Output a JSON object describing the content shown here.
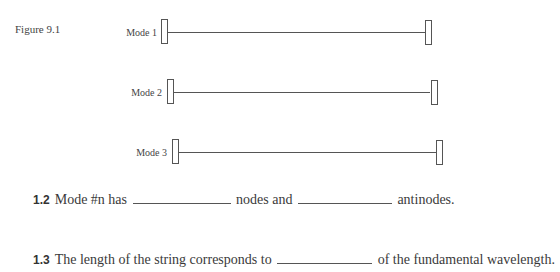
{
  "figure": {
    "label": "Figure 9.1",
    "modes": [
      {
        "label": "Mode 1"
      },
      {
        "label": "Mode 2"
      },
      {
        "label": "Mode 3"
      }
    ]
  },
  "questions": [
    {
      "number": "1.2",
      "parts": [
        "Mode #n has",
        "nodes and",
        "antinodes."
      ],
      "blank_count": 2
    },
    {
      "number": "1.3",
      "parts": [
        "The length of the string corresponds to",
        "of the fundamental wavelength."
      ],
      "blank_count": 1
    }
  ],
  "colors": {
    "ink": "#3a3a3a",
    "line": "#555555",
    "background": "#ffffff"
  }
}
